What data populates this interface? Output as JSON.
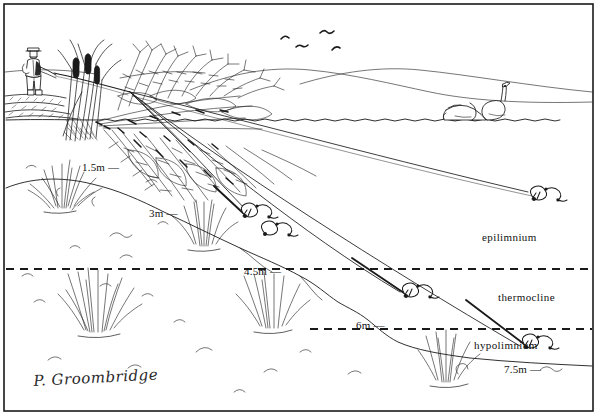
{
  "illustration": {
    "title": "Lake cross-section with angler and thermal stratification",
    "signature": "P. Groombridge",
    "ink_color": "#1a1a1a",
    "background_color": "#ffffff"
  },
  "depth_markers": [
    {
      "id": "d1",
      "label": "1.5m —",
      "value": 1.5,
      "unit": "m",
      "x": 82,
      "y": 161
    },
    {
      "id": "d2",
      "label": "3m —",
      "value": 3.0,
      "unit": "m",
      "x": 149,
      "y": 207
    },
    {
      "id": "d3",
      "label": "4.5m —",
      "value": 4.5,
      "unit": "m",
      "x": 244,
      "y": 265
    },
    {
      "id": "d4",
      "label": "6m —",
      "value": 6.0,
      "unit": "m",
      "x": 356,
      "y": 319
    },
    {
      "id": "d5",
      "label": "7.5m —",
      "value": 7.5,
      "unit": "m",
      "x": 504,
      "y": 363
    }
  ],
  "zone_labels": [
    {
      "id": "z1",
      "label": "epilimnium",
      "x": 482,
      "y": 231
    },
    {
      "id": "z2",
      "label": "thermocline",
      "x": 498,
      "y": 291
    },
    {
      "id": "z3",
      "label": "hypolimnium",
      "x": 474,
      "y": 339
    }
  ],
  "boundaries": {
    "water_surface_y": 120,
    "thermocline_top_y": 269,
    "thermocline_bottom_y": 329,
    "dash_pattern": "8 6"
  },
  "scene_elements": [
    {
      "name": "angler",
      "description": "angler standing on bank casting a rod",
      "x": 30,
      "y": 48
    },
    {
      "name": "reed-bed",
      "description": "reeds / bulrushes at the margin",
      "x": 62,
      "y": 70
    },
    {
      "name": "sunken-tree",
      "description": "submerged fallen tree / brushwood",
      "x": 95,
      "y": 55
    },
    {
      "name": "birds",
      "description": "four birds flying in the sky",
      "x": 275,
      "y": 35
    },
    {
      "name": "swans",
      "description": "two swans on the water surface",
      "x": 450,
      "y": 100
    },
    {
      "name": "far-bank-hills",
      "description": "distant shoreline hills",
      "x": 200,
      "y": 75
    },
    {
      "name": "weed-beds",
      "description": "submerged weed clumps on the lake bed",
      "x": 20,
      "y": 170
    },
    {
      "name": "lake-bed",
      "description": "sloping lake bed contour",
      "x": 0,
      "y": 150
    },
    {
      "name": "lures",
      "description": "five fishing lures/leger rigs at stepped depths",
      "x": 240,
      "y": 215
    }
  ]
}
